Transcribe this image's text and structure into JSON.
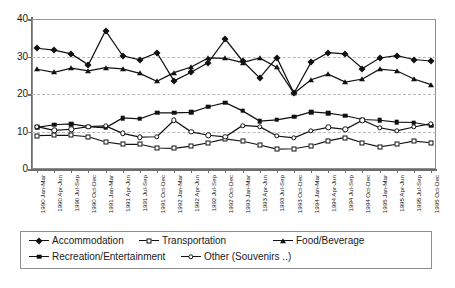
{
  "fragments": {
    "top": "",
    "bottom": ""
  },
  "chart_data": {
    "type": "line",
    "title": "",
    "xlabel": "",
    "ylabel": "",
    "ylim": [
      0,
      40
    ],
    "yticks": [
      0,
      10,
      20,
      30,
      40
    ],
    "gridlines": [
      10,
      20,
      30
    ],
    "grid": true,
    "legend_position": "bottom",
    "categories": [
      "1990 Jan-Mar",
      "1990 Apr-Jun",
      "1990 Jul-Sep",
      "1990 Oct-Dec",
      "1991 Jan-Mar",
      "1991 Apr-Jun",
      "1991 Jul-Sep",
      "1991 Oct-Dec",
      "1992 Jan-Mar",
      "1992 Apr-Jun",
      "1992 Jul-Sep",
      "1992 Oct-Dec",
      "1993 Jan-Mar",
      "1993 Apr-Jun",
      "1993 Jul-Sep",
      "1993 Oct-Dec",
      "1994 Jan-Mar",
      "1994 Apr-Jun",
      "1994 Jul-Sep",
      "1994 Oct-Dec",
      "1995 Jan-Mar",
      "1995 Apr-Jun",
      "1995 Jul-Sep",
      "1995 Oct-Dec"
    ],
    "series": [
      {
        "name": "Accommodation",
        "marker": "diamond",
        "values": [
          32.2,
          31.7,
          30.7,
          27.8,
          36.9,
          30.2,
          29.1,
          31.0,
          23.5,
          25.8,
          28.4,
          34.6,
          28.8,
          24.3,
          29.7,
          20.2,
          28.5,
          31.0,
          30.7,
          26.8,
          29.6,
          30.2,
          29.2,
          28.8
        ]
      },
      {
        "name": "Transportation",
        "marker": "open-square",
        "values": [
          8.9,
          9.0,
          9.0,
          8.6,
          7.2,
          6.6,
          6.6,
          5.6,
          5.5,
          6.1,
          7.0,
          8.0,
          7.4,
          6.4,
          5.3,
          5.4,
          6.2,
          7.5,
          8.4,
          7.0,
          5.9,
          6.6,
          7.4,
          7.0
        ]
      },
      {
        "name": "Food/Beverage",
        "marker": "filled-triangle",
        "values": [
          26.6,
          25.8,
          26.9,
          26.2,
          27.0,
          26.7,
          25.5,
          23.4,
          25.7,
          27.2,
          29.6,
          29.5,
          28.4,
          29.6,
          27.1,
          20.2,
          23.8,
          25.3,
          23.2,
          24.0,
          26.6,
          26.2,
          24.0,
          22.5
        ]
      },
      {
        "name": "Recreation/Entertainment",
        "marker": "filled-square",
        "values": [
          11.1,
          11.8,
          12.0,
          11.3,
          11.0,
          13.6,
          13.4,
          15.0,
          15.0,
          15.1,
          16.6,
          17.7,
          15.5,
          12.8,
          13.1,
          13.9,
          15.2,
          14.9,
          14.2,
          13.2,
          13.0,
          12.5,
          12.4,
          11.6
        ]
      },
      {
        "name": "Other (Souvenirs ..)",
        "marker": "open-circle",
        "values": [
          11.3,
          10.3,
          10.6,
          11.3,
          11.5,
          9.5,
          8.5,
          8.6,
          13.0,
          9.9,
          9.0,
          8.6,
          11.6,
          11.3,
          8.8,
          8.3,
          10.2,
          11.1,
          10.6,
          13.0,
          11.0,
          10.2,
          11.2,
          12.1
        ]
      }
    ]
  },
  "legend": {
    "entries": [
      "Accommodation",
      "Transportation",
      "Food/Beverage",
      "Recreation/Entertainment",
      "Other (Souvenirs ..)"
    ]
  }
}
